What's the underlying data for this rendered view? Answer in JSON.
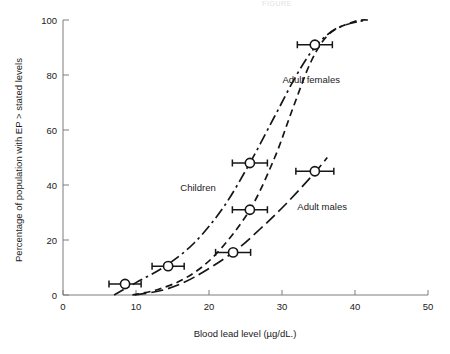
{
  "figure": {
    "top_header_text": "FIGURE",
    "background_color": "#ffffff",
    "line_color": "#161616",
    "axis_color": "#7d7d7d"
  },
  "axes": {
    "x_title": "Blood lead level (µg/dL.)",
    "y_title": "Percentage of population with EP > stated levels",
    "x_ticks": [
      "0",
      "10",
      "20",
      "30",
      "40",
      "50"
    ],
    "y_ticks": [
      "0",
      "20",
      "40",
      "60",
      "80",
      "100"
    ]
  },
  "series_labels": {
    "children": "Children",
    "adult_females": "Adult females",
    "adult_males": "Adult males"
  },
  "chart_data": {
    "type": "line",
    "title": "",
    "xlabel": "Blood lead level (µg/dL.)",
    "ylabel": "Percentage of population with EP > stated levels",
    "xlim": [
      0,
      50
    ],
    "ylim": [
      0,
      100
    ],
    "xticks": [
      0,
      10,
      20,
      30,
      40,
      50
    ],
    "yticks": [
      0,
      20,
      40,
      60,
      80,
      100
    ],
    "grid": false,
    "legend": "inline-annotations",
    "marker": "open-circle",
    "error_bars": "horizontal",
    "series": [
      {
        "name": "Children",
        "linestyle": "dash-dot",
        "points": [
          {
            "x": 8.5,
            "y": 4,
            "xerr": 2.2
          },
          {
            "x": 14.4,
            "y": 10.5,
            "xerr": 2.2
          },
          {
            "x": 25.6,
            "y": 48,
            "xerr": 2.4
          },
          {
            "x": 34.5,
            "y": 91,
            "xerr": 2.4
          }
        ],
        "curve": [
          {
            "x": 7.0,
            "y": 0
          },
          {
            "x": 10.0,
            "y": 4.5
          },
          {
            "x": 14.0,
            "y": 10.5
          },
          {
            "x": 18.0,
            "y": 19.0
          },
          {
            "x": 22.0,
            "y": 32.0
          },
          {
            "x": 25.6,
            "y": 48.0
          },
          {
            "x": 29.0,
            "y": 65.0
          },
          {
            "x": 32.0,
            "y": 80.0
          },
          {
            "x": 34.5,
            "y": 90.0
          },
          {
            "x": 37.5,
            "y": 97.0
          },
          {
            "x": 41.5,
            "y": 100.0
          }
        ]
      },
      {
        "name": "Adult females",
        "linestyle": "short-dash",
        "points": [
          {
            "x": 25.6,
            "y": 31,
            "xerr": 2.4
          }
        ],
        "curve": [
          {
            "x": 9.5,
            "y": 0
          },
          {
            "x": 13.0,
            "y": 2.0
          },
          {
            "x": 17.0,
            "y": 6.5
          },
          {
            "x": 21.0,
            "y": 15.0
          },
          {
            "x": 25.6,
            "y": 31.0
          },
          {
            "x": 29.0,
            "y": 50.0
          },
          {
            "x": 31.5,
            "y": 68.0
          },
          {
            "x": 34.0,
            "y": 85.0
          },
          {
            "x": 36.5,
            "y": 95.0
          },
          {
            "x": 40.0,
            "y": 99.5
          },
          {
            "x": 42.0,
            "y": 100.0
          }
        ]
      },
      {
        "name": "Adult males",
        "linestyle": "long-dash",
        "points": [
          {
            "x": 23.3,
            "y": 15.5,
            "xerr": 2.4
          },
          {
            "x": 34.5,
            "y": 45,
            "xerr": 2.6
          }
        ],
        "curve": [
          {
            "x": 9.8,
            "y": 0
          },
          {
            "x": 14.0,
            "y": 2.0
          },
          {
            "x": 18.0,
            "y": 6.5
          },
          {
            "x": 23.3,
            "y": 15.5
          },
          {
            "x": 27.0,
            "y": 24.0
          },
          {
            "x": 30.5,
            "y": 33.0
          },
          {
            "x": 34.5,
            "y": 44.5
          },
          {
            "x": 36.2,
            "y": 50.0
          }
        ]
      }
    ],
    "annotations": [
      {
        "text": "Children",
        "x": 18.5,
        "y": 38
      },
      {
        "text": "Adult females",
        "x": 34.0,
        "y": 77
      },
      {
        "text": "Adult males",
        "x": 35.5,
        "y": 31
      }
    ]
  }
}
